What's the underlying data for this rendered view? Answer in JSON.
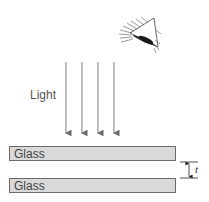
{
  "diagram": {
    "light_label": "Light",
    "plates": [
      {
        "label": "Glass"
      },
      {
        "label": "Glass"
      }
    ],
    "gap_label": "t",
    "rays": 4,
    "icons": [
      "eye-icon"
    ],
    "colors": {
      "plate_fill": "#d9d9d9",
      "plate_border": "#6b6b6b",
      "ray": "#8a8a8a"
    }
  }
}
